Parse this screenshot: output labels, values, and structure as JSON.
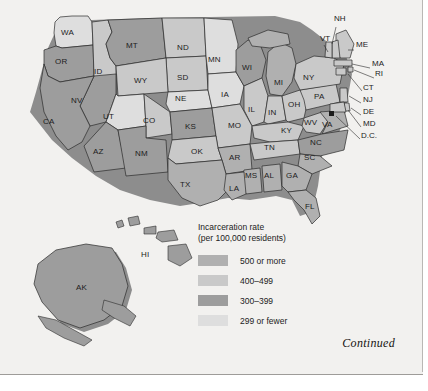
{
  "page": {
    "continued_label": "Continued"
  },
  "legend": {
    "title_line1": "Incarceration rate",
    "title_line2": "(per 100,000 residents)",
    "items": [
      {
        "label": "500 or more",
        "color": "#b0b0b0"
      },
      {
        "label": "400–499",
        "color": "#c9c9c9"
      },
      {
        "label": "300–399",
        "color": "#9d9d9d"
      },
      {
        "label": "299 or fewer",
        "color": "#dedede"
      }
    ]
  },
  "map": {
    "colors": {
      "tier_500_plus": "#b0b0b0",
      "tier_400_499": "#c9c9c9",
      "tier_300_399": "#9d9d9d",
      "tier_299_fewer": "#dedede",
      "outline": "#2b2b2b",
      "shadow": "#8d8d8d",
      "background": "#f2f1ef"
    },
    "states": [
      {
        "code": "WA",
        "x": 68,
        "y": 33,
        "tier": "tier_299_fewer"
      },
      {
        "code": "OR",
        "x": 62,
        "y": 62,
        "tier": "tier_300_399"
      },
      {
        "code": "ID",
        "x": 101,
        "y": 72,
        "tier": "tier_400_499"
      },
      {
        "code": "MT",
        "x": 133,
        "y": 46,
        "tier": "tier_300_399"
      },
      {
        "code": "ND",
        "x": 184,
        "y": 48,
        "tier": "tier_400_499"
      },
      {
        "code": "MN",
        "x": 215,
        "y": 60,
        "tier": "tier_299_fewer"
      },
      {
        "code": "WI",
        "x": 249,
        "y": 68,
        "tier": "tier_300_399"
      },
      {
        "code": "MI",
        "x": 281,
        "y": 83,
        "tier": "tier_500_plus"
      },
      {
        "code": "NY",
        "x": 310,
        "y": 78,
        "tier": "tier_400_499"
      },
      {
        "code": "WY",
        "x": 141,
        "y": 81,
        "tier": "tier_400_499"
      },
      {
        "code": "SD",
        "x": 184,
        "y": 78,
        "tier": "tier_400_499"
      },
      {
        "code": "NE",
        "x": 182,
        "y": 99,
        "tier": "tier_299_fewer"
      },
      {
        "code": "IA",
        "x": 228,
        "y": 95,
        "tier": "tier_299_fewer"
      },
      {
        "code": "IL",
        "x": 255,
        "y": 110,
        "tier": "tier_400_499"
      },
      {
        "code": "IN",
        "x": 275,
        "y": 113,
        "tier": "tier_400_499"
      },
      {
        "code": "OH",
        "x": 295,
        "y": 105,
        "tier": "tier_400_499"
      },
      {
        "code": "PA",
        "x": 321,
        "y": 97,
        "tier": "tier_400_499"
      },
      {
        "code": "NV",
        "x": 78,
        "y": 101,
        "tier": "tier_300_399"
      },
      {
        "code": "UT",
        "x": 110,
        "y": 117,
        "tier": "tier_299_fewer"
      },
      {
        "code": "CO",
        "x": 150,
        "y": 121,
        "tier": "tier_400_499"
      },
      {
        "code": "KS",
        "x": 192,
        "y": 127,
        "tier": "tier_300_399"
      },
      {
        "code": "MO",
        "x": 235,
        "y": 126,
        "tier": "tier_400_499"
      },
      {
        "code": "KY",
        "x": 288,
        "y": 131,
        "tier": "tier_400_499"
      },
      {
        "code": "WV",
        "x": 311,
        "y": 123,
        "tier": "tier_400_499"
      },
      {
        "code": "VA",
        "x": 329,
        "y": 125,
        "tier": "tier_500_plus"
      },
      {
        "code": "CA",
        "x": 50,
        "y": 122,
        "tier": "tier_300_399"
      },
      {
        "code": "AZ",
        "x": 100,
        "y": 152,
        "tier": "tier_300_399"
      },
      {
        "code": "NM",
        "x": 142,
        "y": 154,
        "tier": "tier_300_399"
      },
      {
        "code": "OK",
        "x": 198,
        "y": 152,
        "tier": "tier_400_499"
      },
      {
        "code": "AR",
        "x": 236,
        "y": 158,
        "tier": "tier_500_plus"
      },
      {
        "code": "TN",
        "x": 271,
        "y": 148,
        "tier": "tier_400_499"
      },
      {
        "code": "NC",
        "x": 317,
        "y": 143,
        "tier": "tier_300_399"
      },
      {
        "code": "SC",
        "x": 311,
        "y": 158,
        "tier": "tier_500_plus"
      },
      {
        "code": "MS",
        "x": 252,
        "y": 176,
        "tier": "tier_500_plus"
      },
      {
        "code": "AL",
        "x": 271,
        "y": 176,
        "tier": "tier_500_plus"
      },
      {
        "code": "GA",
        "x": 293,
        "y": 176,
        "tier": "tier_500_plus"
      },
      {
        "code": "TX",
        "x": 187,
        "y": 185,
        "tier": "tier_500_plus"
      },
      {
        "code": "LA",
        "x": 236,
        "y": 189,
        "tier": "tier_500_plus"
      },
      {
        "code": "FL",
        "x": 312,
        "y": 207,
        "tier": "tier_500_plus"
      },
      {
        "code": "AK",
        "x": 83,
        "y": 288,
        "tier": "tier_300_399"
      },
      {
        "code": "HI",
        "x": 148,
        "y": 255,
        "tier": "tier_300_399"
      }
    ],
    "leader_labels": [
      {
        "code": "NH",
        "x": 334,
        "y": 19
      },
      {
        "code": "VT",
        "x": 320,
        "y": 39
      },
      {
        "code": "ME",
        "x": 356,
        "y": 45
      },
      {
        "code": "MA",
        "x": 372,
        "y": 64
      },
      {
        "code": "RI",
        "x": 375,
        "y": 74
      },
      {
        "code": "CT",
        "x": 363,
        "y": 88
      },
      {
        "code": "NJ",
        "x": 363,
        "y": 100
      },
      {
        "code": "DE",
        "x": 363,
        "y": 112
      },
      {
        "code": "MD",
        "x": 363,
        "y": 124
      },
      {
        "code": "D.C.",
        "x": 361,
        "y": 136
      }
    ]
  }
}
